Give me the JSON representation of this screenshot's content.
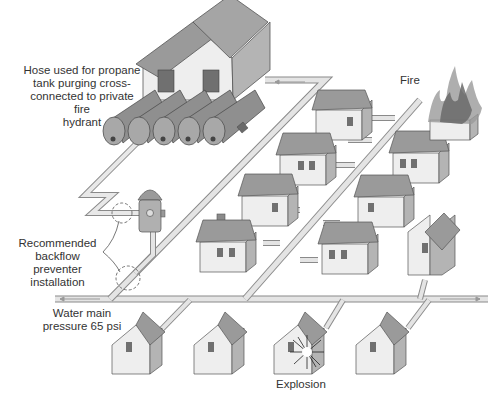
{
  "diagram": {
    "labels": {
      "hose": [
        "Hose used for propane",
        "tank purging cross-",
        "connected to private fire",
        "hydrant"
      ],
      "fire": "Fire",
      "backflow": [
        "Recommended",
        "backflow preventer",
        "installation"
      ],
      "water_main": [
        "Water main",
        "pressure 65 psi"
      ],
      "explosion": "Explosion"
    },
    "elements": {
      "propane_tanks_count": 5,
      "houses_count": 13,
      "fire_hydrant": "private fire hydrant",
      "backflow_markers": 2
    },
    "colors": {
      "background": "#ffffff",
      "pipe": "#d8d8d8",
      "pipe_outline": "#8a8a8a",
      "house_wall": "#eeeeee",
      "house_side": "#b4b4b4",
      "roof": "#9a9a9a",
      "tank": "#8f8f8f",
      "window": "#707070",
      "fire": "#6a6a6a"
    }
  }
}
